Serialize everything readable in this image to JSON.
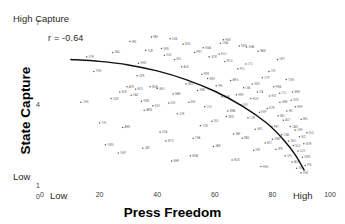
{
  "chart_data": {
    "type": "scatter",
    "title": "",
    "xlabel": "Press Freedom",
    "ylabel": "State Capture",
    "annotation": "r = -0.64",
    "correlation": -0.64,
    "xlim": [
      0,
      100
    ],
    "ylim": [
      1,
      7
    ],
    "grid": false,
    "legend": null,
    "xticks": [
      0,
      20,
      40,
      60,
      80,
      100
    ],
    "yticks": [
      1,
      4,
      7
    ],
    "x_axis_endcaps": {
      "low": "Low",
      "high": "High"
    },
    "y_axis_endcaps": {
      "low": "Low Capture",
      "high": "High Capture"
    },
    "y_axis_low_text": "Low",
    "y_axis_high_text": "High Capture",
    "trend": {
      "type": "quadratic-fit",
      "description": "downward curving fit, flat at left, steep at right",
      "points": [
        [
          10,
          5.62
        ],
        [
          20,
          5.55
        ],
        [
          30,
          5.42
        ],
        [
          40,
          5.2
        ],
        [
          50,
          4.88
        ],
        [
          60,
          4.45
        ],
        [
          70,
          3.88
        ],
        [
          78,
          3.28
        ],
        [
          84,
          2.65
        ],
        [
          88,
          2.1
        ],
        [
          91,
          1.55
        ]
      ]
    },
    "points": [
      {
        "x": 13.5,
        "y": 4.05,
        "label": "CHN"
      },
      {
        "x": 20.0,
        "y": 3.28,
        "label": "TJK"
      },
      {
        "x": 24.0,
        "y": 4.18,
        "label": "UZB"
      },
      {
        "x": 27.0,
        "y": 4.42,
        "label": "BLR"
      },
      {
        "x": 29.5,
        "y": 4.62,
        "label": "AZE"
      },
      {
        "x": 31.0,
        "y": 4.3,
        "label": "KAZ"
      },
      {
        "x": 32.5,
        "y": 4.52,
        "label": "RUS"
      },
      {
        "x": 33.0,
        "y": 5.02,
        "label": "UKR"
      },
      {
        "x": 34.5,
        "y": 4.08,
        "label": "VNM"
      },
      {
        "x": 35.5,
        "y": 3.75,
        "label": "ARM"
      },
      {
        "x": 36.0,
        "y": 5.95,
        "label": "TUR"
      },
      {
        "x": 37.5,
        "y": 4.62,
        "label": "MDA"
      },
      {
        "x": 38.5,
        "y": 3.92,
        "label": "EGY"
      },
      {
        "x": 40.0,
        "y": 4.55,
        "label": "GEO"
      },
      {
        "x": 41.0,
        "y": 2.95,
        "label": "DZA"
      },
      {
        "x": 42.5,
        "y": 5.78,
        "label": "KGZ"
      },
      {
        "x": 44.0,
        "y": 4.02,
        "label": "IDN"
      },
      {
        "x": 45.5,
        "y": 4.35,
        "label": "MAR"
      },
      {
        "x": 47.0,
        "y": 3.62,
        "label": "JOR"
      },
      {
        "x": 48.5,
        "y": 5.35,
        "label": "ALB"
      },
      {
        "x": 50.0,
        "y": 4.72,
        "label": "MKD"
      },
      {
        "x": 51.0,
        "y": 4.05,
        "label": "BIH"
      },
      {
        "x": 52.5,
        "y": 2.72,
        "label": "THA"
      },
      {
        "x": 54.0,
        "y": 4.48,
        "label": "SRB"
      },
      {
        "x": 55.5,
        "y": 5.08,
        "label": "PER"
      },
      {
        "x": 56.5,
        "y": 3.88,
        "label": "COL"
      },
      {
        "x": 57.5,
        "y": 4.92,
        "label": "MEX"
      },
      {
        "x": 59.0,
        "y": 3.35,
        "label": "IND"
      },
      {
        "x": 60.5,
        "y": 4.65,
        "label": "PHL"
      },
      {
        "x": 61.5,
        "y": 5.82,
        "label": "ECU"
      },
      {
        "x": 62.5,
        "y": 4.25,
        "label": "BGR"
      },
      {
        "x": 63.5,
        "y": 5.55,
        "label": "ROU"
      },
      {
        "x": 64.5,
        "y": 3.72,
        "label": "BRA"
      },
      {
        "x": 65.5,
        "y": 4.85,
        "label": "ARG"
      },
      {
        "x": 66.5,
        "y": 2.88,
        "label": "ZAF"
      },
      {
        "x": 67.5,
        "y": 4.32,
        "label": "HRV"
      },
      {
        "x": 68.0,
        "y": 5.28,
        "label": "POL"
      },
      {
        "x": 69.0,
        "y": 3.95,
        "label": "SVK"
      },
      {
        "x": 70.0,
        "y": 4.58,
        "label": "LVA"
      },
      {
        "x": 70.8,
        "y": 5.45,
        "label": "LTU"
      },
      {
        "x": 71.5,
        "y": 3.48,
        "label": "CZE"
      },
      {
        "x": 72.5,
        "y": 4.18,
        "label": "HUN"
      },
      {
        "x": 73.0,
        "y": 4.72,
        "label": "SVN"
      },
      {
        "x": 74.0,
        "y": 3.05,
        "label": "GRC"
      },
      {
        "x": 74.8,
        "y": 4.42,
        "label": "ITA"
      },
      {
        "x": 75.5,
        "y": 3.68,
        "label": "ESP"
      },
      {
        "x": 76.5,
        "y": 4.95,
        "label": "CYP"
      },
      {
        "x": 77.5,
        "y": 2.55,
        "label": "MLT"
      },
      {
        "x": 78.2,
        "y": 3.82,
        "label": "KOR"
      },
      {
        "x": 79.0,
        "y": 4.28,
        "label": "EST"
      },
      {
        "x": 79.8,
        "y": 3.15,
        "label": "PRT"
      },
      {
        "x": 80.5,
        "y": 4.62,
        "label": "FRA"
      },
      {
        "x": 81.2,
        "y": 2.32,
        "label": "JPN"
      },
      {
        "x": 82.0,
        "y": 3.55,
        "label": "BEL"
      },
      {
        "x": 82.6,
        "y": 4.05,
        "label": "GBR"
      },
      {
        "x": 83.2,
        "y": 2.85,
        "label": "USA"
      },
      {
        "x": 83.8,
        "y": 3.38,
        "label": "AUT"
      },
      {
        "x": 84.4,
        "y": 2.08,
        "label": "CHL"
      },
      {
        "x": 85.0,
        "y": 3.72,
        "label": "IRL"
      },
      {
        "x": 85.6,
        "y": 2.62,
        "label": "DEU"
      },
      {
        "x": 86.2,
        "y": 3.15,
        "label": "CAN"
      },
      {
        "x": 86.8,
        "y": 1.85,
        "label": "AUS"
      },
      {
        "x": 87.3,
        "y": 2.45,
        "label": "NLD"
      },
      {
        "x": 87.9,
        "y": 3.02,
        "label": "CHE"
      },
      {
        "x": 88.4,
        "y": 1.62,
        "label": "ISL"
      },
      {
        "x": 88.9,
        "y": 2.25,
        "label": "LUX"
      },
      {
        "x": 89.4,
        "y": 2.78,
        "label": "NZL"
      },
      {
        "x": 89.9,
        "y": 1.45,
        "label": "DNK"
      },
      {
        "x": 90.4,
        "y": 2.02,
        "label": "SWE"
      },
      {
        "x": 90.9,
        "y": 2.52,
        "label": "NOR"
      },
      {
        "x": 91.4,
        "y": 1.72,
        "label": "FIN"
      },
      {
        "x": 56.0,
        "y": 6.05,
        "label": "NGA"
      },
      {
        "x": 62.0,
        "y": 6.22,
        "label": "UGA"
      },
      {
        "x": 68.5,
        "y": 6.12,
        "label": "KEN"
      },
      {
        "x": 44.5,
        "y": 6.38,
        "label": "LKA"
      },
      {
        "x": 49.0,
        "y": 6.18,
        "label": "BGD"
      },
      {
        "x": 38.0,
        "y": 6.45,
        "label": "PAK"
      },
      {
        "x": 30.5,
        "y": 6.28,
        "label": "IRN"
      },
      {
        "x": 41.5,
        "y": 6.02,
        "label": "VEN"
      },
      {
        "x": 33.5,
        "y": 5.48,
        "label": "KHM"
      },
      {
        "x": 46.0,
        "y": 5.62,
        "label": "BOL"
      },
      {
        "x": 53.0,
        "y": 5.88,
        "label": "PRY"
      },
      {
        "x": 58.0,
        "y": 5.72,
        "label": "GTM"
      },
      {
        "x": 63.0,
        "y": 6.35,
        "label": "HND"
      },
      {
        "x": 71.0,
        "y": 6.08,
        "label": "GHA"
      },
      {
        "x": 75.0,
        "y": 5.92,
        "label": "NAM"
      },
      {
        "x": 78.8,
        "y": 5.18,
        "label": "CRI"
      },
      {
        "x": 81.8,
        "y": 5.62,
        "label": "URY"
      },
      {
        "x": 84.8,
        "y": 4.88,
        "label": "TWN"
      },
      {
        "x": 87.0,
        "y": 4.42,
        "label": "BRB"
      },
      {
        "x": 22.0,
        "y": 2.48,
        "label": "OMN"
      },
      {
        "x": 26.5,
        "y": 2.18,
        "label": "SGP"
      },
      {
        "x": 18.0,
        "y": 5.18,
        "label": "TKM"
      },
      {
        "x": 15.5,
        "y": 5.72,
        "label": "SYR"
      },
      {
        "x": 24.5,
        "y": 5.88,
        "label": "SAU"
      },
      {
        "x": 28.0,
        "y": 3.12,
        "label": "ARE"
      },
      {
        "x": 35.0,
        "y": 2.35,
        "label": "QAT"
      },
      {
        "x": 43.0,
        "y": 2.62,
        "label": "MYS"
      },
      {
        "x": 51.5,
        "y": 2.08,
        "label": "BWA"
      },
      {
        "x": 66.0,
        "y": 1.92,
        "label": "MUS"
      },
      {
        "x": 73.5,
        "y": 2.28,
        "label": "ISR"
      },
      {
        "x": 92.0,
        "y": 2.92,
        "label": "NLD"
      },
      {
        "x": 90.0,
        "y": 3.42,
        "label": "BEL"
      },
      {
        "x": 86.5,
        "y": 4.12,
        "label": "SVN"
      },
      {
        "x": 82.5,
        "y": 4.38,
        "label": "LTU"
      },
      {
        "x": 45.0,
        "y": 1.88,
        "label": "BHR"
      },
      {
        "x": 59.5,
        "y": 2.42,
        "label": "JAM"
      },
      {
        "x": 76.0,
        "y": 1.68,
        "label": "HKG"
      },
      {
        "x": 69.5,
        "y": 2.72,
        "label": "PAN"
      },
      {
        "x": 55.0,
        "y": 3.18,
        "label": "TUN"
      },
      {
        "x": 64.0,
        "y": 3.52,
        "label": "SEN"
      },
      {
        "x": 80.0,
        "y": 2.68,
        "label": "ZMB"
      },
      {
        "x": 88.0,
        "y": 3.88,
        "label": "ESP"
      }
    ]
  }
}
